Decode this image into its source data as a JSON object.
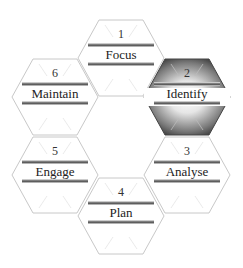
{
  "diagram": {
    "type": "hexagon-cycle",
    "highlight_color": "#3a3a3a",
    "outline_color": "#c8c8c8",
    "steps": [
      {
        "number": "1",
        "label": "Focus",
        "highlighted": false
      },
      {
        "number": "2",
        "label": "Identify",
        "highlighted": true
      },
      {
        "number": "3",
        "label": "Analyse",
        "highlighted": false
      },
      {
        "number": "4",
        "label": "Plan",
        "highlighted": false
      },
      {
        "number": "5",
        "label": "Engage",
        "highlighted": false
      },
      {
        "number": "6",
        "label": "Maintain",
        "highlighted": false
      }
    ]
  }
}
